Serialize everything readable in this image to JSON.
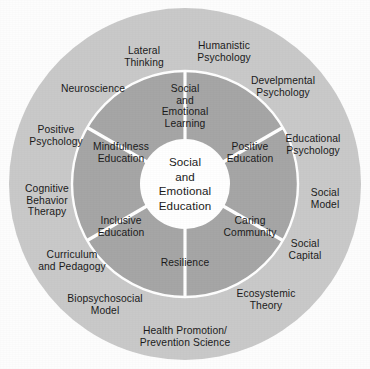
{
  "figure": {
    "center": {
      "text": "Social\nand\nEmotional\nEducation"
    },
    "inner_ring": {
      "items": [
        {
          "label": "Social\nand\nEmotional\nLearning",
          "angle_deg": 0,
          "radius_frac": 0.655
        },
        {
          "label": "Positive\nEducation",
          "angle_deg": 60,
          "radius_frac": 0.66
        },
        {
          "label": "Caring\nCommunity",
          "angle_deg": 120,
          "radius_frac": 0.66
        },
        {
          "label": "Resilience",
          "angle_deg": 180,
          "radius_frac": 0.68
        },
        {
          "label": "Inclusive\nEducation",
          "angle_deg": 240,
          "radius_frac": 0.66
        },
        {
          "label": "Mindfulness\nEducation",
          "angle_deg": 300,
          "radius_frac": 0.66
        }
      ]
    },
    "outer_ring": {
      "items": [
        {
          "label": "Lateral\nThinking",
          "angle_deg": 334
        },
        {
          "label": "Humanistic\nPsychology",
          "angle_deg": 18
        },
        {
          "label": "Develpmental\nPsychology",
          "angle_deg": 46
        },
        {
          "label": "Educational\nPsychology",
          "angle_deg": 72
        },
        {
          "label": "Social\nModel",
          "angle_deg": 95
        },
        {
          "label": "Social\nCapital",
          "angle_deg": 119
        },
        {
          "label": "Ecosystemic\nTheory",
          "angle_deg": 143
        },
        {
          "label": "Health Promotion/\nPrevention Science",
          "angle_deg": 172
        },
        {
          "label": "Biopsychosocial\nModel",
          "angle_deg": 205
        },
        {
          "label": "Curriculum\nand Pedagogy",
          "angle_deg": 230
        },
        {
          "label": "Cognitive\nBehavior\nTherapy",
          "angle_deg": 258
        },
        {
          "label": "Positive\nPsychology",
          "angle_deg": 285
        },
        {
          "label": "Neuroscience",
          "angle_deg": 307
        }
      ]
    },
    "colors": {
      "outer_ring_fill": "#c9c9c9",
      "inner_ring_fill": "#a6a6a6",
      "center_fill": "#ffffff",
      "divider": "#ffffff",
      "text": "#1b1b1b",
      "background": "#fdfdfd"
    },
    "geometry": {
      "cx": 185,
      "cy": 184,
      "outer_radius": 176,
      "inner_ring_outer_radius": 113,
      "center_radius": 45,
      "divider_width": 3.2,
      "wedge_count": 6,
      "wedge_rotation_deg": 30
    }
  }
}
